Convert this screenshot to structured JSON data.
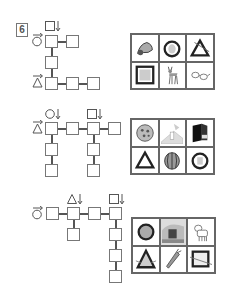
{
  "exercise": {
    "number": "6"
  },
  "puzzles": [
    {
      "id": 1,
      "clues": [
        {
          "symbol": "square",
          "direction": "down",
          "start_cell": "r0c0"
        },
        {
          "symbol": "circle",
          "direction": "right",
          "start_cell": "r0c0"
        },
        {
          "symbol": "triangle",
          "direction": "right",
          "start_cell": "r2c0"
        }
      ],
      "pictures": [
        {
          "name": "hermit-crab"
        },
        {
          "name": "owl-in-circle"
        },
        {
          "name": "triangle-with-stick"
        },
        {
          "name": "framed-picture"
        },
        {
          "name": "deer"
        },
        {
          "name": "glasses"
        }
      ]
    },
    {
      "id": 2,
      "clues": [
        {
          "symbol": "circle",
          "direction": "down",
          "start_cell": "r0c0"
        },
        {
          "symbol": "square",
          "direction": "down",
          "start_cell": "r0c2"
        },
        {
          "symbol": "triangle",
          "direction": "right",
          "start_cell": "r0c0"
        }
      ],
      "pictures": [
        {
          "name": "pizza"
        },
        {
          "name": "mountain-tower"
        },
        {
          "name": "open-book"
        },
        {
          "name": "warning-triangle"
        },
        {
          "name": "watermelon"
        },
        {
          "name": "wreath"
        }
      ]
    },
    {
      "id": 3,
      "clues": [
        {
          "symbol": "circle",
          "direction": "right",
          "start_cell": "r0c0"
        },
        {
          "symbol": "triangle",
          "direction": "down",
          "start_cell": "r0c1"
        },
        {
          "symbol": "square",
          "direction": "down",
          "start_cell": "r0c3"
        }
      ],
      "pictures": [
        {
          "name": "round-tray"
        },
        {
          "name": "house-scene"
        },
        {
          "name": "puppy"
        },
        {
          "name": "tent-triangle"
        },
        {
          "name": "carrot"
        },
        {
          "name": "square-frame"
        }
      ]
    }
  ]
}
